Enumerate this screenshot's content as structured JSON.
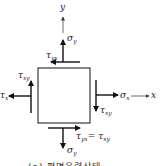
{
  "diagram": {
    "type": "plane stress element",
    "axes": {
      "x_label": "x",
      "y_label": "y"
    },
    "labels": {
      "sigma_y_top": {
        "sym": "σ",
        "sub": "y"
      },
      "tau_yx_top": {
        "sym": "τ",
        "sub": "yx"
      },
      "tau_xy_left": {
        "sym": "τ",
        "sub": "xy"
      },
      "sigma_x_left": {
        "sym": "τ",
        "sub": "x"
      },
      "sigma_x_right": {
        "sym": "σ",
        "sub": "x"
      },
      "tau_xy_right": {
        "sym": "τ",
        "sub": "xy"
      },
      "tau_yx_bottom": {
        "sym": "τ",
        "sub": "yx",
        "eq": "= ",
        "sym2": "τ",
        "sub2": "xy"
      },
      "sigma_y_bottom": {
        "sym": "σ",
        "sub": "y"
      }
    },
    "caption": "(a) 평면응력상태",
    "colors": {
      "stroke": "#111111",
      "background": "#ffffff"
    }
  }
}
